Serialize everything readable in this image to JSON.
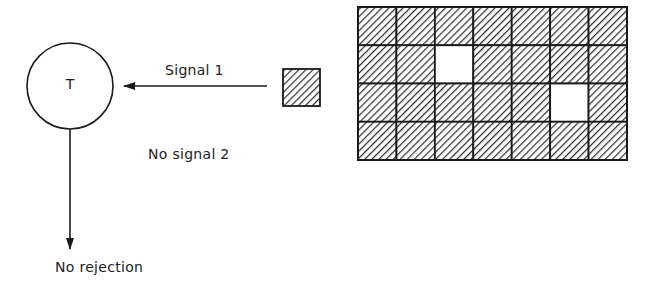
{
  "diagram": {
    "node": {
      "label": "T",
      "shape": "circle",
      "cx": 70,
      "cy": 86,
      "r": 43
    },
    "signal_arrow": {
      "label": "Signal 1",
      "from": [
        267,
        86
      ],
      "to": [
        123,
        86
      ]
    },
    "signal_source": {
      "shape": "hatched-square",
      "x": 283,
      "y": 69,
      "size": 37
    },
    "missing_signal": {
      "label": "No signal 2"
    },
    "output_arrow": {
      "label": "No rejection",
      "from": [
        70,
        129
      ],
      "to": [
        70,
        248
      ]
    },
    "grid": {
      "x": 358,
      "y": 7,
      "cols": 7,
      "rows": 4,
      "cell_width": 38.43,
      "cell_height": 38.25,
      "empty_cells": [
        {
          "row": 1,
          "col": 2
        },
        {
          "row": 2,
          "col": 5
        }
      ]
    },
    "colors": {
      "stroke": "#1a1a1a",
      "background": "#ffffff",
      "hatch": "#2a2a2a"
    }
  }
}
